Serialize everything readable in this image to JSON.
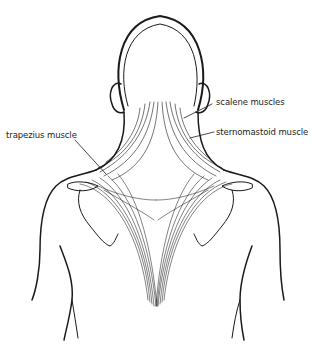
{
  "figure": {
    "labels": [
      {
        "id": "scalene",
        "text": "scalene muscles"
      },
      {
        "id": "sternomastoid",
        "text": "sternomastoid muscle"
      },
      {
        "id": "trapezius",
        "text": "trapezius muscle"
      }
    ]
  },
  "colors": {
    "line": "#1a1a1a",
    "background": "#ffffff"
  }
}
